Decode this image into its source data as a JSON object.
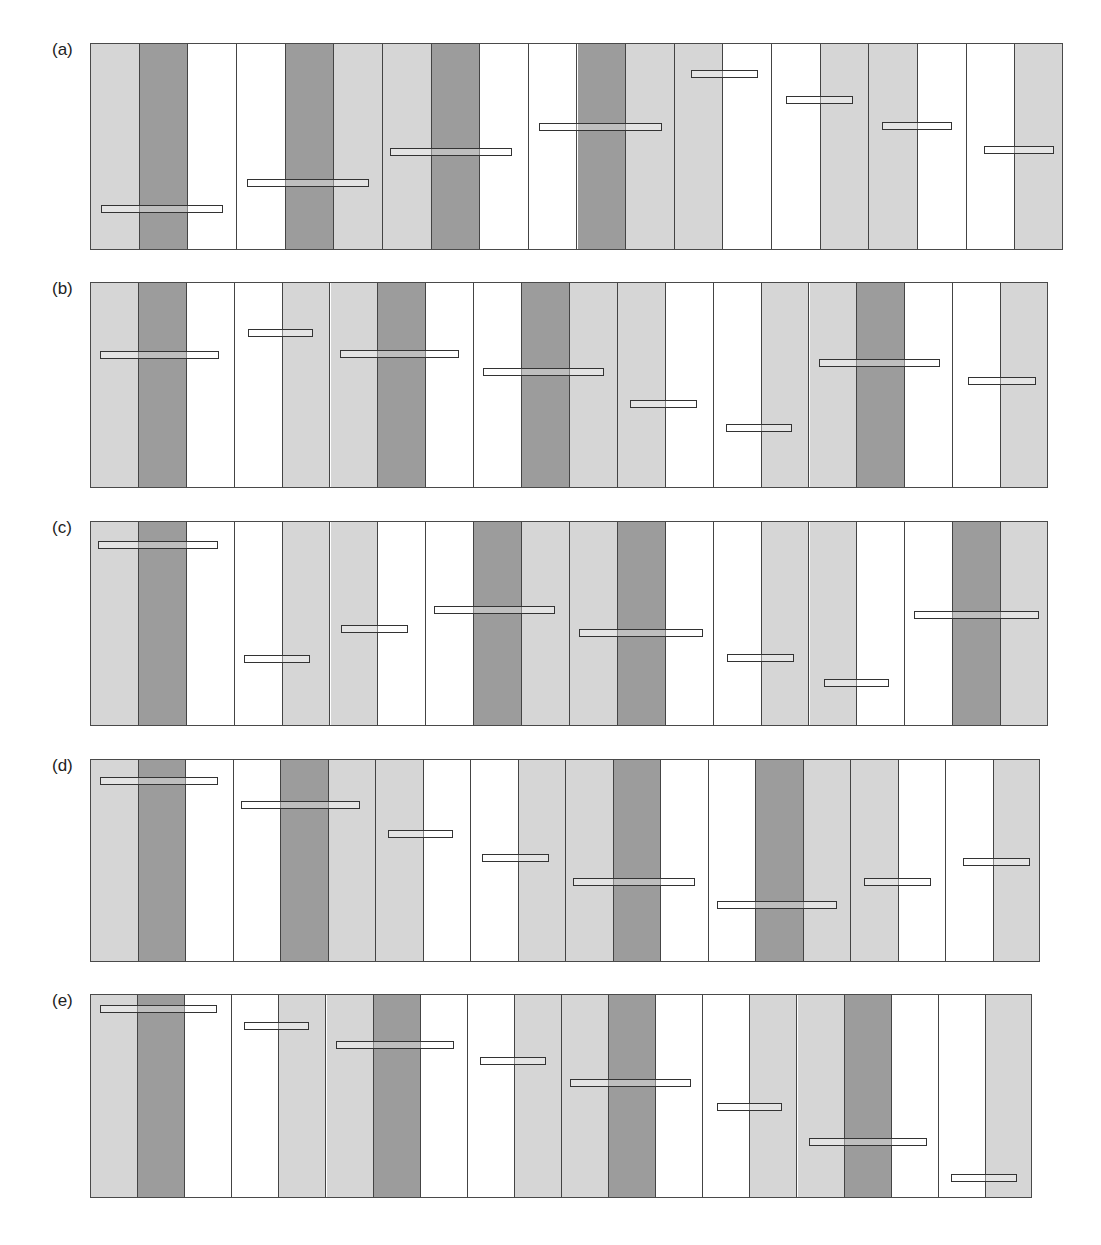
{
  "figure": {
    "panels": [
      {
        "label": "(a)",
        "x": 90,
        "y": 43,
        "w": 973,
        "h": 207,
        "columns": [
          "L",
          "D",
          "W",
          "W",
          "D",
          "L",
          "L",
          "D",
          "W",
          "W",
          "D",
          "L",
          "L",
          "W",
          "W",
          "L",
          "L",
          "W",
          "W",
          "L"
        ],
        "bars": [
          [
            100,
            222,
            208
          ],
          [
            246,
            368,
            182
          ],
          [
            389,
            511,
            151
          ],
          [
            538,
            661,
            126
          ],
          [
            690,
            757,
            73
          ],
          [
            785,
            852,
            99
          ],
          [
            881,
            951,
            125
          ],
          [
            983,
            1053,
            149
          ]
        ]
      },
      {
        "label": "(b)",
        "x": 90,
        "y": 282,
        "w": 958,
        "h": 206,
        "columns": [
          "L",
          "D",
          "W",
          "W",
          "L",
          "L",
          "D",
          "W",
          "W",
          "D",
          "L",
          "L",
          "W",
          "W",
          "L",
          "L",
          "D",
          "W",
          "W",
          "L"
        ],
        "bars": [
          [
            99,
            218,
            354
          ],
          [
            247,
            312,
            332
          ],
          [
            339,
            458,
            353
          ],
          [
            482,
            603,
            371
          ],
          [
            629,
            696,
            403
          ],
          [
            725,
            791,
            427
          ],
          [
            818,
            939,
            362
          ],
          [
            967,
            1035,
            380
          ]
        ]
      },
      {
        "label": "(c)",
        "x": 90,
        "y": 521,
        "w": 958,
        "h": 205,
        "columns": [
          "L",
          "D",
          "W",
          "W",
          "L",
          "L",
          "W",
          "W",
          "D",
          "L",
          "L",
          "D",
          "W",
          "W",
          "L",
          "L",
          "W",
          "W",
          "D",
          "L"
        ],
        "bars": [
          [
            97,
            217,
            544
          ],
          [
            243,
            309,
            658
          ],
          [
            340,
            407,
            628
          ],
          [
            433,
            554,
            609
          ],
          [
            578,
            702,
            632
          ],
          [
            726,
            793,
            657
          ],
          [
            823,
            888,
            682
          ],
          [
            913,
            1038,
            614
          ]
        ]
      },
      {
        "label": "(d)",
        "x": 90,
        "y": 759,
        "w": 950,
        "h": 203,
        "columns": [
          "L",
          "D",
          "W",
          "W",
          "D",
          "L",
          "L",
          "W",
          "W",
          "L",
          "L",
          "D",
          "W",
          "W",
          "D",
          "L",
          "L",
          "W",
          "W",
          "L"
        ],
        "bars": [
          [
            99,
            217,
            780
          ],
          [
            240,
            359,
            804
          ],
          [
            387,
            452,
            833
          ],
          [
            481,
            548,
            857
          ],
          [
            572,
            694,
            881
          ],
          [
            716,
            836,
            904
          ],
          [
            863,
            930,
            881
          ],
          [
            962,
            1029,
            861
          ]
        ]
      },
      {
        "label": "(e)",
        "x": 90,
        "y": 994,
        "w": 942,
        "h": 204,
        "columns": [
          "L",
          "D",
          "W",
          "W",
          "L",
          "L",
          "D",
          "W",
          "W",
          "L",
          "L",
          "D",
          "W",
          "W",
          "L",
          "L",
          "D",
          "W",
          "W",
          "L"
        ],
        "bars": [
          [
            99,
            216,
            1008
          ],
          [
            243,
            308,
            1025
          ],
          [
            335,
            453,
            1044
          ],
          [
            479,
            545,
            1060
          ],
          [
            569,
            690,
            1082
          ],
          [
            716,
            781,
            1106
          ],
          [
            808,
            926,
            1141
          ],
          [
            950,
            1016,
            1177
          ]
        ]
      }
    ],
    "colors": {
      "L": "#d6d6d6",
      "D": "#9c9c9c",
      "W": "#ffffff",
      "stroke": "#444444"
    }
  },
  "chart_data": {
    "type": "diagram",
    "panels": [
      {
        "label": "(a)",
        "bar_height_fraction_from_top": [
          0.8,
          0.67,
          0.52,
          0.4,
          0.15,
          0.27,
          0.4,
          0.51
        ]
      },
      {
        "label": "(b)",
        "bar_height_fraction_from_top": [
          0.35,
          0.24,
          0.35,
          0.43,
          0.59,
          0.7,
          0.39,
          0.48
        ]
      },
      {
        "label": "(c)",
        "bar_height_fraction_from_top": [
          0.11,
          0.67,
          0.52,
          0.43,
          0.54,
          0.66,
          0.79,
          0.45
        ]
      },
      {
        "label": "(d)",
        "bar_height_fraction_from_top": [
          0.1,
          0.22,
          0.37,
          0.48,
          0.6,
          0.72,
          0.6,
          0.5
        ]
      },
      {
        "label": "(e)",
        "bar_height_fraction_from_top": [
          0.07,
          0.15,
          0.25,
          0.33,
          0.43,
          0.55,
          0.72,
          0.9
        ]
      }
    ]
  }
}
